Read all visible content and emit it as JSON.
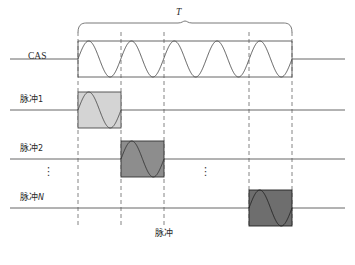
{
  "figure": {
    "type": "timing-diagram",
    "title_symbol": "T",
    "bottom_caption": "脉冲",
    "background_color": "#ffffff",
    "line_color": "#555555",
    "dashed_line_color": "#777777",
    "text_color": "#2b2b2b"
  },
  "period_brace": {
    "label": "T",
    "label_style": "italic",
    "x_start": 78,
    "x_end": 292
  },
  "rows": [
    {
      "label": "CAS",
      "label_script": "latin",
      "type": "carrier",
      "baseline_y": 59,
      "box_x_start": 78,
      "box_x_end": 292,
      "box_top": 41,
      "box_bottom": 77,
      "cycles": 5,
      "fill_color": "none",
      "stroke_color": "#4a4a4a"
    },
    {
      "label": "脉冲1",
      "label_script": "cjk",
      "type": "pulse",
      "baseline_y": 110,
      "box_x_start": 78,
      "box_x_end": 121,
      "box_top": 92,
      "box_bottom": 128,
      "cycles": 1,
      "fill_color": "#d4d4d4",
      "stroke_color": "#4a4a4a"
    },
    {
      "label": "脉冲2",
      "label_script": "cjk",
      "type": "pulse",
      "baseline_y": 159,
      "box_x_start": 121,
      "box_x_end": 164,
      "box_top": 141,
      "box_bottom": 177,
      "cycles": 1,
      "fill_color": "#8d8d8d",
      "stroke_color": "#333333"
    },
    {
      "label": "脉冲N",
      "label_script": "cjk",
      "label_suffix_italic": "N",
      "type": "pulse",
      "baseline_y": 208,
      "box_x_start": 249,
      "box_x_end": 292,
      "box_top": 190,
      "box_bottom": 226,
      "cycles": 1,
      "fill_color": "#6e6e6e",
      "stroke_color": "#222222"
    }
  ],
  "dashed_lines": {
    "x_positions": [
      78,
      121,
      164,
      249,
      292
    ],
    "y_top": 32,
    "y_bottom": 228
  },
  "ellipses": [
    {
      "name": "row-ellipsis-left",
      "glyph": "⋮",
      "x": 43,
      "y": 168
    },
    {
      "name": "row-ellipsis-middle",
      "glyph": "⋮",
      "x": 200,
      "y": 168
    }
  ],
  "labels": {
    "cas": "CAS",
    "pulse1_prefix": "脉冲",
    "pulse1_index": "1",
    "pulse2_prefix": "脉冲",
    "pulse2_index": "2",
    "pulseN_prefix": "脉冲",
    "pulseN_index": "N",
    "bottom": "脉冲",
    "period": "T"
  },
  "chart_data": {
    "type": "line",
    "title": "",
    "xlabel": "脉冲",
    "ylabel": "",
    "grid": false,
    "legend": "none",
    "annotations": [
      "T",
      "⋮"
    ],
    "series": [
      {
        "name": "CAS",
        "waveform": "sine",
        "cycles": 5,
        "window_start": 78,
        "window_end": 292,
        "amplitude_top": 41,
        "amplitude_bottom": 77
      },
      {
        "name": "脉冲1",
        "waveform": "sine",
        "cycles": 1,
        "window_start": 78,
        "window_end": 121,
        "amplitude_top": 92,
        "amplitude_bottom": 128
      },
      {
        "name": "脉冲2",
        "waveform": "sine",
        "cycles": 1,
        "window_start": 121,
        "window_end": 164,
        "amplitude_top": 141,
        "amplitude_bottom": 177
      },
      {
        "name": "脉冲N",
        "waveform": "sine",
        "cycles": 1,
        "window_start": 249,
        "window_end": 292,
        "amplitude_top": 190,
        "amplitude_bottom": 226
      }
    ]
  }
}
